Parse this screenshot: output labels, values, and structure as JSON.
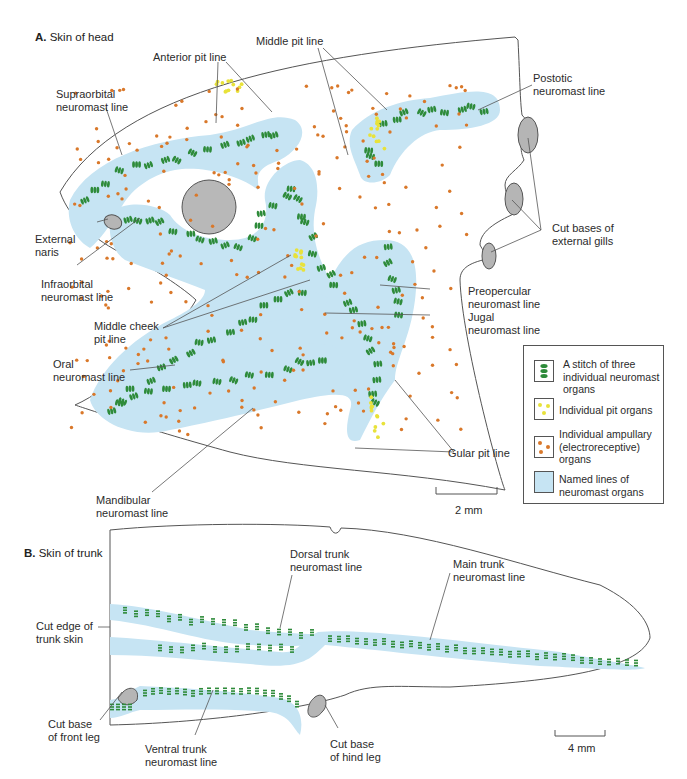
{
  "panel_a": {
    "letter": "A.",
    "title": "Skin of head",
    "labels": {
      "anterior_pit_line": "Anterior pit line",
      "middle_pit_line": "Middle pit line",
      "supraorbital": "Supraorbital\nneuromast line",
      "postotic": "Postotic\nneuromast line",
      "external_naris": "External\nnaris",
      "cut_bases_gills": "Cut bases of\nexternal gills",
      "infraorbital": "Infraorbital\nneuromast line",
      "middle_cheek_pit_line": "Middle cheek\npit line",
      "preopercular": "Preopercular\nneuromast line",
      "jugal": "Jugal\nneuromast line",
      "oral": "Oral\nneuromast line",
      "gular_pit_line": "Gular pit line",
      "mandibular": "Mandibular\nneuromast line"
    },
    "scale_bar": "2 mm"
  },
  "legend": {
    "items": [
      {
        "swatch": "stitch-green",
        "label": "A stitch of three\nindividual neuromast\norgans"
      },
      {
        "swatch": "pit-yellow",
        "label": "Individual pit organs"
      },
      {
        "swatch": "ampullary-orange",
        "label": "Individual ampullary\n(electroreceptive)\norgans"
      },
      {
        "swatch": "line-blue",
        "label": "Named lines of\nneuromast organs"
      }
    ]
  },
  "panel_b": {
    "letter": "B.",
    "title": "Skin of trunk",
    "labels": {
      "dorsal_trunk": "Dorsal trunk\nneuromast line",
      "main_trunk": "Main trunk\nneuromast line",
      "cut_edge": "Cut edge of\ntrunk skin",
      "cut_base_front_leg": "Cut base\nof front leg",
      "ventral_trunk": "Ventral trunk\nneuromast line",
      "cut_base_hind_leg": "Cut base\nof hind leg"
    },
    "scale_bar": "4 mm"
  },
  "colors": {
    "neuromast_green": "#2e8b3a",
    "pit_yellow": "#e8e23a",
    "ampullary_orange": "#d9782a",
    "line_blue": "#c6e4f3",
    "cut_gray": "#b5b5b5",
    "outline": "#555555"
  }
}
